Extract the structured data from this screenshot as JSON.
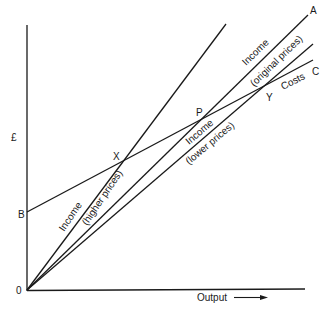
{
  "diagram": {
    "type": "break-even diagram",
    "axes": {
      "y_label": "£",
      "x_label": "Output",
      "origin_label": "0"
    },
    "lines": [
      {
        "id": "costs",
        "label": "Costs",
        "end_label": "C",
        "intercept_label": "B"
      },
      {
        "id": "income_original",
        "label_line1": "Income",
        "label_line2": "(original prices)",
        "end_label": "A"
      },
      {
        "id": "income_higher",
        "label_line1": "Income",
        "label_line2": "(higher prices)"
      },
      {
        "id": "income_lower",
        "label_line1": "Income",
        "label_line2": "(lower prices)"
      }
    ],
    "points": [
      {
        "id": "X",
        "label": "X",
        "description": "break-even at higher prices"
      },
      {
        "id": "P",
        "label": "P",
        "description": "break-even at original prices"
      },
      {
        "id": "Y",
        "label": "Y",
        "description": "break-even at lower prices"
      }
    ],
    "line_color": "#1a1a1a",
    "background": "#ffffff"
  }
}
